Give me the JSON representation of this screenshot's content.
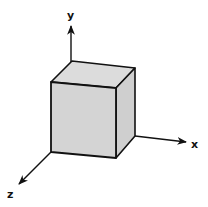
{
  "diagram": {
    "title": "",
    "axes": [
      {
        "name": "x",
        "label": "x"
      },
      {
        "name": "y",
        "label": "y"
      },
      {
        "name": "z",
        "label": "z"
      }
    ],
    "colors": {
      "cube_face": "#d4d4d4",
      "cube_top": "#dcdcdc",
      "cube_side": "#cfcfcf",
      "stroke": "#111111",
      "background": "#ffffff"
    }
  }
}
